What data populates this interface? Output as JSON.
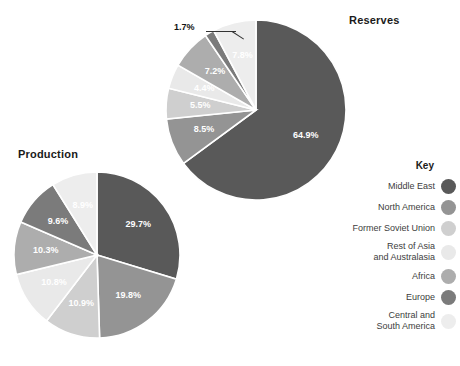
{
  "chart_data": [
    {
      "type": "pie",
      "title": "Reserves",
      "categories": [
        "Middle East",
        "North America",
        "Former Soviet Union",
        "Rest of Asia and Australasia",
        "Africa",
        "Europe",
        "Central and South America"
      ],
      "values": [
        64.9,
        8.5,
        5.5,
        4.4,
        7.2,
        1.7,
        7.8
      ],
      "labels": [
        "64.9%",
        "8.5%",
        "5.5%",
        "4.4%",
        "7.2%",
        "1.7%",
        "7.8%"
      ],
      "unit": "percent",
      "start_angle": 0,
      "direction": "clockwise",
      "legend": "right",
      "grid": false
    },
    {
      "type": "pie",
      "title": "Production",
      "categories": [
        "Middle East",
        "North America",
        "Former Soviet Union",
        "Rest of Asia and Australasia",
        "Africa",
        "Europe",
        "Central and South America"
      ],
      "values": [
        29.7,
        19.8,
        10.9,
        10.8,
        10.3,
        9.6,
        8.9
      ],
      "labels": [
        "29.7%",
        "19.8%",
        "10.9%",
        "10.8%",
        "10.3%",
        "9.6%",
        "8.9%"
      ],
      "unit": "percent",
      "start_angle": 0,
      "direction": "clockwise",
      "legend": "right",
      "grid": false
    }
  ],
  "titles": {
    "reserves": "Reserves",
    "production": "Production"
  },
  "callout": {
    "reserves_europe": "1.7%"
  },
  "legend": {
    "title": "Key",
    "items": [
      {
        "label": "Middle East",
        "color": "#595959"
      },
      {
        "label": "North America",
        "color": "#949494"
      },
      {
        "label": "Former Soviet Union",
        "color": "#cfcfcf"
      },
      {
        "label": "Rest of Asia\nand Australasia",
        "color": "#e9e9e9"
      },
      {
        "label": "Africa",
        "color": "#adadad"
      },
      {
        "label": "Europe",
        "color": "#7b7b7b"
      },
      {
        "label": "Central and\nSouth America",
        "color": "#ededed"
      }
    ]
  }
}
